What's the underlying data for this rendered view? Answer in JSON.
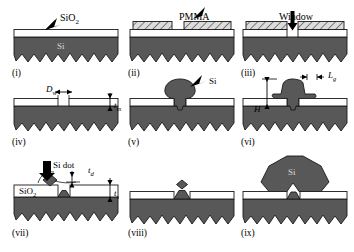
{
  "figure": {
    "kind": "process-flow-schematic",
    "colors": {
      "silicon": "#585858",
      "silicon_stroke": "#1a1a1a",
      "oxide_fill": "#ffffff",
      "pmma_fill": "#d9d9d9",
      "hatch_stroke": "#333333",
      "arrow": "#000000",
      "background": "#ffffff",
      "si_text": "#d9d9d9"
    },
    "panel_labels": [
      "(i)",
      "(ii)",
      "(iii)",
      "(iv)",
      "(v)",
      "(vi)",
      "(vii)",
      "(viii)",
      "(ix)"
    ],
    "top_annotations": [
      {
        "id": "sio2-callout",
        "text": "SiO",
        "sub": "2",
        "panel": "(i)"
      },
      {
        "id": "pmma-callout",
        "text": "PMMA",
        "panel": "(ii)"
      },
      {
        "id": "window-callout",
        "text": "Window",
        "panel": "(iii)"
      }
    ],
    "material_labels": [
      {
        "id": "si-substrate-label",
        "text": "Si",
        "panel": "(i)"
      },
      {
        "id": "si-blob-callout",
        "text": "Si",
        "panel": "(v)"
      },
      {
        "id": "sio2-layer-label",
        "text": "SiO",
        "sub": "2",
        "panel": "(vii)"
      },
      {
        "id": "si-dot-callout",
        "text": "Si dot",
        "panel": "(vii)"
      },
      {
        "id": "si-crystal-label",
        "text": "Si",
        "panel": "(ix)"
      }
    ],
    "dimensions": [
      {
        "id": "window-diameter",
        "symbol": "D",
        "sub": "w",
        "panel": "(iv)",
        "orientation": "horizontal"
      },
      {
        "id": "mask-thickness",
        "symbol": "t",
        "sub": "m",
        "panel": "(iv)",
        "orientation": "vertical"
      },
      {
        "id": "growth-height",
        "symbol": "H",
        "sub": "",
        "panel": "(vi)",
        "orientation": "vertical"
      },
      {
        "id": "gap-length",
        "symbol": "L",
        "sub": "g",
        "panel": "(vi)",
        "orientation": "horizontal"
      },
      {
        "id": "dot-thickness",
        "symbol": "t",
        "sub": "d",
        "panel": "(vii)",
        "orientation": "vertical"
      },
      {
        "id": "oxide-thickness",
        "symbol": "t",
        "sub": "s",
        "panel": "(vii)",
        "orientation": "vertical"
      }
    ],
    "panels": [
      {
        "label": "(i)",
        "caption": "SiO2 layer grown on textured Si substrate"
      },
      {
        "label": "(ii)",
        "caption": "PMMA resist patterned on oxide"
      },
      {
        "label": "(iii)",
        "caption": "Window opened through oxide"
      },
      {
        "label": "(iv)",
        "caption": "Resist removed, window of diameter Dw in mask of thickness tm"
      },
      {
        "label": "(v)",
        "caption": "Si nucleates and grows out of the window"
      },
      {
        "label": "(vi)",
        "caption": "Si overgrowth of height H with gap Lg"
      },
      {
        "label": "(vii)",
        "caption": "Si dot remaining in window, thickness td, oxide ts"
      },
      {
        "label": "(viii)",
        "caption": "Oxide stripped leaving Si dot on textured surface"
      },
      {
        "label": "(ix)",
        "caption": "Large Si crystal regrown from the seed dot"
      }
    ]
  }
}
